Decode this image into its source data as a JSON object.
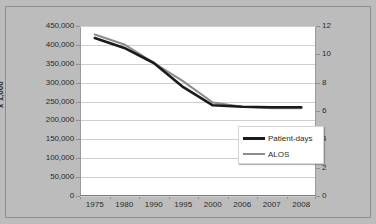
{
  "chart_data": {
    "type": "line",
    "title": "",
    "xlabel": "",
    "ylabel": "x 1,000",
    "ylabel_right": "",
    "categories": [
      "1975",
      "1980",
      "1990",
      "1995",
      "2000",
      "2006",
      "2007",
      "2008"
    ],
    "ylim": [
      0,
      450000
    ],
    "ylim_right": [
      0,
      12
    ],
    "yticks": [
      "0",
      "50,000",
      "100,000",
      "150,000",
      "200,000",
      "250,000",
      "300,000",
      "350,000",
      "400,000",
      "450,000"
    ],
    "ytick_values": [
      0,
      50000,
      100000,
      150000,
      200000,
      250000,
      300000,
      350000,
      400000,
      450000
    ],
    "yticks_right": [
      "0",
      "2",
      "4",
      "6",
      "8",
      "10",
      "12"
    ],
    "ytick_values_right": [
      0,
      2,
      4,
      6,
      8,
      10,
      12
    ],
    "grid": true,
    "legend_position": "bottom-right",
    "series": [
      {
        "name": "Patient-days",
        "axis": "left",
        "color": "#1a1a1a",
        "values": [
          418000,
          392000,
          352000,
          288000,
          240000,
          236000,
          235000,
          235000
        ]
      },
      {
        "name": "ALOS",
        "axis": "right",
        "color": "#8c8c8c",
        "values": [
          11.4,
          10.7,
          9.4,
          8.1,
          6.6,
          6.3,
          6.2,
          6.2
        ]
      }
    ]
  },
  "colors": {
    "background": "#bcbcbc",
    "plot_background": "#ffffff",
    "gridline": "#cfcfcf",
    "axis": "#8f8f8f",
    "text": "#2b2b2b",
    "patient_days": "#1a1a1a",
    "alos": "#8c8c8c"
  },
  "legend": {
    "items": [
      {
        "label": "Patient-days",
        "color": "#1a1a1a"
      },
      {
        "label": "ALOS",
        "color": "#8c8c8c"
      }
    ]
  }
}
